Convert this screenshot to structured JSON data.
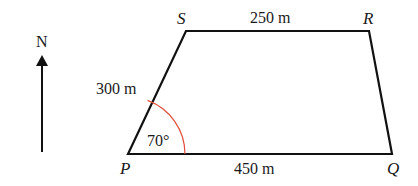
{
  "diagram": {
    "type": "trapezium",
    "compass": {
      "label": "N"
    },
    "vertices": {
      "P": {
        "label": "P"
      },
      "Q": {
        "label": "Q"
      },
      "R": {
        "label": "R"
      },
      "S": {
        "label": "S"
      }
    },
    "sides": {
      "SR": {
        "label": "250 m"
      },
      "PS": {
        "label": "300 m"
      },
      "PQ": {
        "label": "450 m"
      }
    },
    "angle_P": {
      "label": "70°",
      "arc_color": "#e0503c"
    },
    "colors": {
      "line": "#111111",
      "arc": "#e0503c",
      "background": "#ffffff"
    }
  }
}
